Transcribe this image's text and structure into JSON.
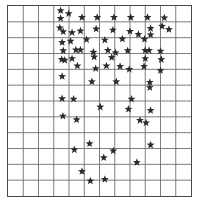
{
  "chart_data": {
    "type": "scatter",
    "title": "",
    "subtitle": "",
    "xlabel": "",
    "ylabel": "",
    "marker": "star",
    "marker_color": "#2b2b2b",
    "marker_size": 4.2,
    "grid": true,
    "grid_color": "#6e6e6e",
    "border_color": "#4a4a4a",
    "background": "#ffffff",
    "legend": null,
    "legend_position": "none",
    "tick_labels_x": [],
    "tick_labels_y": [],
    "grid_columns": 12,
    "grid_rows": 12,
    "xlim": [
      0,
      12
    ],
    "ylim": [
      0,
      12
    ],
    "plot_area_px": {
      "x": 7,
      "y": 5,
      "width": 185,
      "height": 192
    },
    "point_count": 74,
    "points": [
      {
        "x": 3.45,
        "y": 11.7
      },
      {
        "x": 3.45,
        "y": 11.22
      },
      {
        "x": 3.98,
        "y": 11.52
      },
      {
        "x": 4.85,
        "y": 11.28
      },
      {
        "x": 5.85,
        "y": 11.28
      },
      {
        "x": 6.95,
        "y": 11.28
      },
      {
        "x": 8.05,
        "y": 11.28
      },
      {
        "x": 9.15,
        "y": 11.28
      },
      {
        "x": 10.25,
        "y": 11.25
      },
      {
        "x": 3.4,
        "y": 10.62
      },
      {
        "x": 3.62,
        "y": 10.38
      },
      {
        "x": 4.2,
        "y": 10.32
      },
      {
        "x": 4.75,
        "y": 10.42
      },
      {
        "x": 5.78,
        "y": 10.55
      },
      {
        "x": 6.88,
        "y": 10.48
      },
      {
        "x": 8.0,
        "y": 10.4
      },
      {
        "x": 8.55,
        "y": 10.2
      },
      {
        "x": 9.35,
        "y": 10.58
      },
      {
        "x": 9.35,
        "y": 10.18
      },
      {
        "x": 10.1,
        "y": 10.72
      },
      {
        "x": 10.55,
        "y": 10.52
      },
      {
        "x": 3.55,
        "y": 9.7
      },
      {
        "x": 4.1,
        "y": 9.78
      },
      {
        "x": 5.15,
        "y": 9.88
      },
      {
        "x": 6.35,
        "y": 9.85
      },
      {
        "x": 7.5,
        "y": 9.92
      },
      {
        "x": 8.95,
        "y": 9.9
      },
      {
        "x": 3.62,
        "y": 9.18
      },
      {
        "x": 4.45,
        "y": 9.22
      },
      {
        "x": 4.75,
        "y": 9.22
      },
      {
        "x": 5.6,
        "y": 9.08
      },
      {
        "x": 6.55,
        "y": 9.2
      },
      {
        "x": 7.05,
        "y": 9.05
      },
      {
        "x": 7.85,
        "y": 9.18
      },
      {
        "x": 9.0,
        "y": 9.2
      },
      {
        "x": 9.25,
        "y": 9.2
      },
      {
        "x": 10.0,
        "y": 9.15
      },
      {
        "x": 3.52,
        "y": 8.62
      },
      {
        "x": 3.72,
        "y": 8.58
      },
      {
        "x": 4.2,
        "y": 8.68
      },
      {
        "x": 5.65,
        "y": 8.78
      },
      {
        "x": 6.8,
        "y": 8.75
      },
      {
        "x": 9.0,
        "y": 8.68
      },
      {
        "x": 10.05,
        "y": 8.62
      },
      {
        "x": 4.55,
        "y": 8.22
      },
      {
        "x": 5.75,
        "y": 8.05
      },
      {
        "x": 6.45,
        "y": 8.22
      },
      {
        "x": 7.35,
        "y": 8.18
      },
      {
        "x": 7.95,
        "y": 8.0
      },
      {
        "x": 8.92,
        "y": 8.18
      },
      {
        "x": 10.0,
        "y": 7.92
      },
      {
        "x": 3.55,
        "y": 7.55
      },
      {
        "x": 5.5,
        "y": 7.22
      },
      {
        "x": 7.1,
        "y": 7.22
      },
      {
        "x": 9.3,
        "y": 7.18
      },
      {
        "x": 9.3,
        "y": 6.85
      },
      {
        "x": 3.55,
        "y": 6.15
      },
      {
        "x": 4.3,
        "y": 6.12
      },
      {
        "x": 8.1,
        "y": 6.12
      },
      {
        "x": 6.05,
        "y": 5.62
      },
      {
        "x": 7.9,
        "y": 5.48
      },
      {
        "x": 9.35,
        "y": 5.4
      },
      {
        "x": 3.6,
        "y": 5.05
      },
      {
        "x": 4.5,
        "y": 4.82
      },
      {
        "x": 8.65,
        "y": 4.78
      },
      {
        "x": 9.05,
        "y": 4.62
      },
      {
        "x": 5.35,
        "y": 3.3
      },
      {
        "x": 9.35,
        "y": 3.22
      },
      {
        "x": 4.35,
        "y": 2.92
      },
      {
        "x": 6.9,
        "y": 2.85
      },
      {
        "x": 6.28,
        "y": 2.42
      },
      {
        "x": 8.45,
        "y": 2.12
      },
      {
        "x": 4.85,
        "y": 1.55
      },
      {
        "x": 5.4,
        "y": 0.95
      },
      {
        "x": 6.35,
        "y": 1.05
      }
    ]
  }
}
